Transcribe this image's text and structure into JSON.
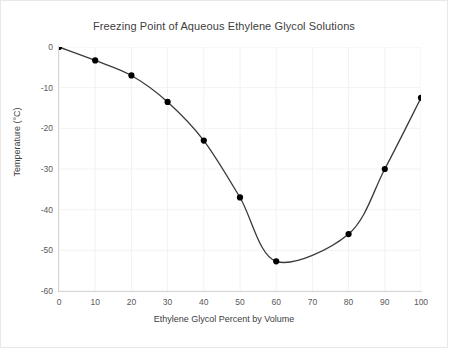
{
  "chart_data": {
    "type": "line",
    "title": "Freezing Point of Aqueous Ethylene Glycol Solutions",
    "xlabel": "Ethylene Glycol Percent by Volume",
    "ylabel": "Temperature (°C)",
    "x": [
      0,
      10,
      20,
      30,
      40,
      50,
      60,
      80,
      90,
      100
    ],
    "values": [
      0,
      -3.3,
      -7,
      -13.5,
      -23,
      -37,
      -52.7,
      -46,
      -30,
      -12.5
    ],
    "series": [
      {
        "name": "Freezing Point",
        "x": [
          0,
          10,
          20,
          30,
          40,
          50,
          60,
          80,
          90,
          100
        ],
        "values": [
          0,
          -3.3,
          -7,
          -13.5,
          -23,
          -37,
          -52.7,
          -46,
          -30,
          -12.5
        ]
      }
    ],
    "xlim": [
      0,
      100
    ],
    "ylim": [
      -60,
      0
    ],
    "xticks": [
      "0",
      "10",
      "20",
      "30",
      "40",
      "50",
      "60",
      "70",
      "80",
      "90",
      "100"
    ],
    "yticks": [
      "0",
      "-10",
      "-20",
      "-30",
      "-40",
      "-50",
      "-60"
    ],
    "xtick_values": [
      0,
      10,
      20,
      30,
      40,
      50,
      60,
      70,
      80,
      90,
      100
    ],
    "ytick_values": [
      0,
      -10,
      -20,
      -30,
      -40,
      -50,
      -60
    ],
    "grid": true,
    "legend": "none",
    "marker": "circle",
    "line_color": "#3a3a3a",
    "marker_color": "#000000",
    "grid_color": "#f2f2f2",
    "axis_color": "#d4d4d4",
    "background": "#ffffff"
  }
}
